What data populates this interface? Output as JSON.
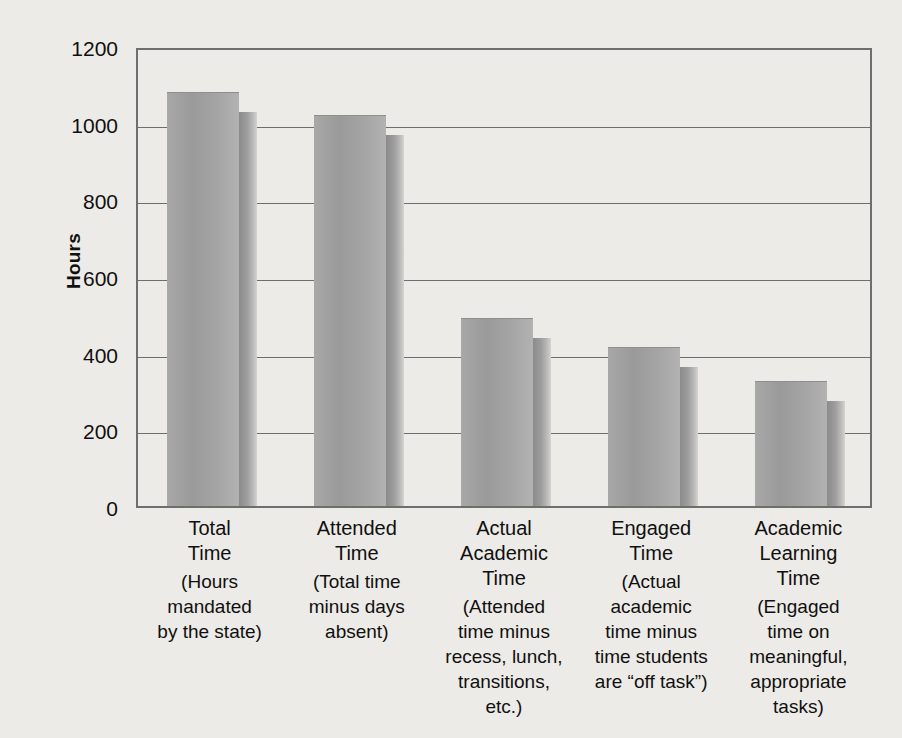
{
  "chart_data": {
    "type": "bar",
    "title": "",
    "xlabel": "",
    "ylabel": "Hours",
    "ylim": [
      0,
      1200
    ],
    "ytick_values": [
      1200,
      1000,
      800,
      600,
      400,
      200,
      0
    ],
    "ytick_labels": [
      "1200",
      "1000",
      "800",
      "600",
      "400",
      "200",
      "0"
    ],
    "grid": true,
    "legend": "none",
    "categories": [
      "Total\nTime",
      "Attended\nTime",
      "Actual\nAcademic\nTime",
      "Engaged\nTime",
      "Academic\nLearning\nTime"
    ],
    "category_descriptions": [
      "(Hours\nmandated\nby the state)",
      "(Total time\nminus days\nabsent)",
      "(Attended\ntime minus\nrecess, lunch,\ntransitions,\netc.)",
      "(Actual\nacademic\ntime minus\ntime students\nare “off task”)",
      "(Engaged\ntime on\nmeaningful,\nappropriate\ntasks)"
    ],
    "values": [
      1080,
      1020,
      490,
      415,
      325
    ]
  },
  "colors": {
    "background": "#edebe7",
    "bar_face": "#a3a3a3",
    "bar_shadow": "#8b8b8b",
    "gridline": "#6e6e6e",
    "axis": "#6e6e6e",
    "text": "#101010"
  }
}
